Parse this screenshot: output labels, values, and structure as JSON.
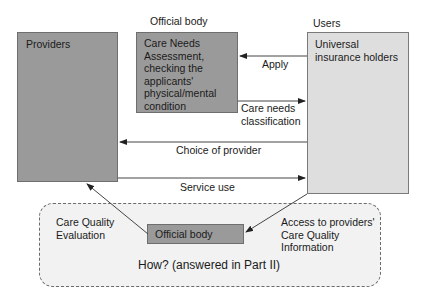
{
  "diagram": {
    "providers": {
      "label": "Providers"
    },
    "official_body_top": {
      "heading": "Official body",
      "lines": [
        "Care Needs",
        "Assessment,",
        "checking the",
        "applicants'",
        "physical/mental",
        "condition"
      ]
    },
    "users": {
      "heading": "Users",
      "lines": [
        "Universal",
        "insurance holders"
      ]
    },
    "arrows": {
      "apply": "Apply",
      "care_needs_classification": [
        "Care needs",
        "classification"
      ],
      "choice_of_provider": "Choice of provider",
      "service_use": "Service use"
    },
    "quality_panel": {
      "care_quality_evaluation": [
        "Care Quality",
        "Evaluation"
      ],
      "official_body": "Official body",
      "access_info": [
        "Access to providers'",
        "Care Quality",
        "Information"
      ],
      "question": "How? (answered in Part II)"
    },
    "colors": {
      "dark_box": "#9a9a9a",
      "light_box": "#dedede",
      "panel": "#f2f2f2",
      "line": "#333333"
    }
  }
}
